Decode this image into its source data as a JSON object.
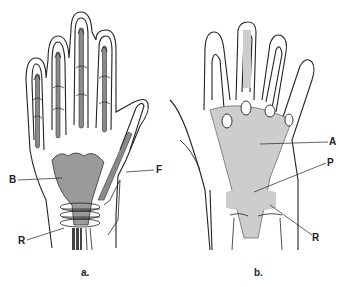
{
  "figure": {
    "panels": [
      {
        "id": "a",
        "caption": "a.",
        "view": "palmar hand with digital tendon sheaths",
        "labels": [
          {
            "key": "B",
            "text": "B"
          },
          {
            "key": "F",
            "text": "F"
          },
          {
            "key": "R",
            "text": "R"
          }
        ]
      },
      {
        "id": "b",
        "caption": "b.",
        "view": "palmar aponeurosis",
        "labels": [
          {
            "key": "A",
            "text": "A"
          },
          {
            "key": "P",
            "text": "P"
          },
          {
            "key": "R",
            "text": "R"
          }
        ]
      }
    ],
    "colors": {
      "outline": "#222222",
      "tendon_fill": "#8a8a8a",
      "bursa_fill": "#9a9a9a",
      "background": "#ffffff"
    }
  }
}
